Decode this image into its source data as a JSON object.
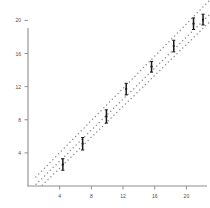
{
  "chart_data": {
    "type": "scatter",
    "title": "",
    "subtitle": "",
    "xlabel": "",
    "ylabel": "",
    "xlim": [
      0.5,
      23.0
    ],
    "ylim": [
      0.0,
      22.5
    ],
    "grid": false,
    "legend_position": "none",
    "x_ticks": [
      4,
      8,
      12,
      16,
      20
    ],
    "y_ticks": [
      4,
      8,
      12,
      16,
      20
    ],
    "x_tick_labels": [
      "4",
      "8",
      "12",
      "16",
      "20"
    ],
    "y_tick_labels": [
      "4",
      "8",
      "16",
      "12",
      "20"
    ],
    "marker": "point-with-vertical-error-bar",
    "marker_color": "#1a1a1a",
    "line_style": "dotted",
    "line_color": "#8a8a8a",
    "series": [
      {
        "name": "observations",
        "type": "scatter",
        "x": [
          4.4,
          6.9,
          9.9,
          12.4,
          15.6,
          18.4,
          20.9,
          22.1
        ],
        "y": [
          2.6,
          5.1,
          8.4,
          11.7,
          14.4,
          16.9,
          19.6,
          20.1
        ],
        "yerr": [
          0.7,
          0.75,
          0.8,
          0.7,
          0.65,
          0.7,
          0.7,
          0.65
        ]
      },
      {
        "name": "fit",
        "type": "line",
        "x": [
          1.0,
          22.8
        ],
        "y": [
          0.2,
          20.6
        ]
      },
      {
        "name": "upper-band",
        "type": "line",
        "x": [
          1.0,
          22.8
        ],
        "y": [
          1.1,
          22.3
        ]
      },
      {
        "name": "lower-band",
        "type": "line",
        "x": [
          1.8,
          22.8
        ],
        "y": [
          0.1,
          19.7
        ]
      }
    ],
    "annotations": []
  },
  "axes": {
    "x_axis_name": "x-axis",
    "y_axis_name": "y-axis",
    "spine_color": "#8f8f8f"
  }
}
